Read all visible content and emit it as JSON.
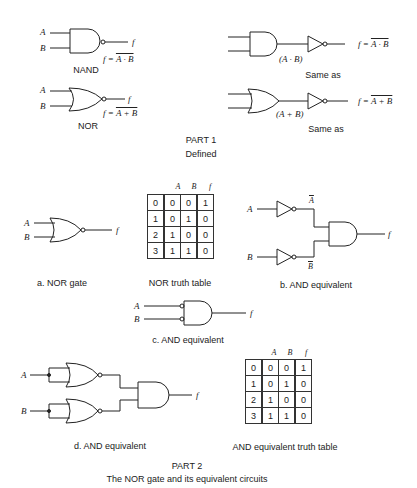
{
  "part1": {
    "title": "PART 1",
    "subtitle": "Defined",
    "nand": {
      "label": "NAND",
      "input_a": "A",
      "input_b": "B",
      "output": "f",
      "equation_lhs": "f = ",
      "equation_rhs": "A · B"
    },
    "nor": {
      "label": "NOR",
      "input_a": "A",
      "input_b": "B",
      "output": "f",
      "equation_lhs": "f = ",
      "equation_rhs": "A + B"
    },
    "nand_same": {
      "intermediate": "(A · B)",
      "label": "Same as",
      "equation_lhs": "f = ",
      "equation_rhs": "A · B"
    },
    "nor_same": {
      "intermediate": "(A + B)",
      "label": "Same as",
      "equation_lhs": "f = ",
      "equation_rhs": "A + B"
    }
  },
  "part2": {
    "title": "PART 2",
    "subtitle": "The  NOR gate  and  its  equivalent  circuits",
    "a": {
      "caption": "a. NOR gate",
      "input_a": "A",
      "input_b": "B",
      "output": "f"
    },
    "nor_table": {
      "caption": "NOR truth table",
      "headers": [
        "A",
        "B",
        "f"
      ],
      "rows": [
        [
          "0",
          "0",
          "0",
          "1"
        ],
        [
          "1",
          "0",
          "1",
          "0"
        ],
        [
          "2",
          "1",
          "0",
          "0"
        ],
        [
          "3",
          "1",
          "1",
          "0"
        ]
      ]
    },
    "b": {
      "caption": "b. AND equivalent",
      "input_a": "A",
      "input_b": "B",
      "a_bar": "A",
      "b_bar": "B",
      "output": "f"
    },
    "c": {
      "caption": "c. AND equivalent",
      "input_a": "A",
      "input_b": "B",
      "output": "f"
    },
    "d": {
      "caption": "d. AND equivalent",
      "input_a": "A",
      "input_b": "B",
      "output": "f"
    },
    "and_table": {
      "caption": "AND equivalent truth table",
      "headers": [
        "A",
        "B",
        "f"
      ],
      "rows": [
        [
          "0",
          "0",
          "0",
          "1"
        ],
        [
          "1",
          "0",
          "1",
          "0"
        ],
        [
          "2",
          "1",
          "0",
          "0"
        ],
        [
          "3",
          "1",
          "1",
          "0"
        ]
      ]
    }
  }
}
